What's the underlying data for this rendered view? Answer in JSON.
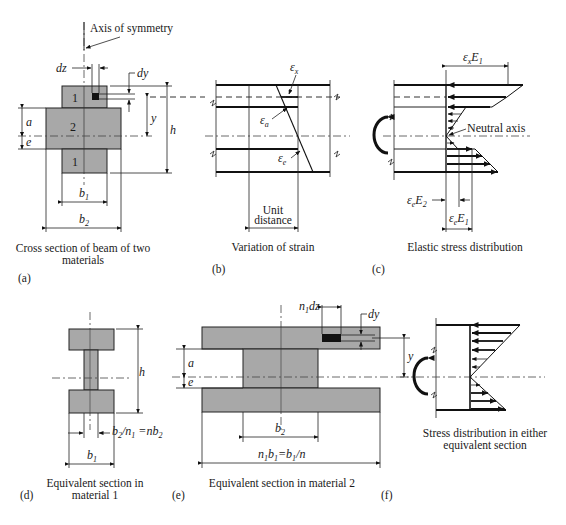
{
  "figure": {
    "panels": [
      {
        "id": "a",
        "tag": "(a)",
        "caption_lines": [
          "Cross section of beam of two",
          "materials"
        ],
        "labels": {
          "axis": "Axis of symmetry",
          "dz": "dz",
          "dy": "dy",
          "region_top": "1",
          "region_mid": "2",
          "region_bot": "1",
          "a": "a",
          "e": "e",
          "y": "y",
          "h": "h",
          "b1": "b",
          "b1_sub": "1",
          "b2": "b",
          "b2_sub": "2"
        }
      },
      {
        "id": "b",
        "tag": "(b)",
        "caption_lines": [
          "Variation of strain"
        ],
        "labels": {
          "ex": "ε",
          "ex_sub": "x",
          "ea": "ε",
          "ea_sub": "a",
          "ee": "ε",
          "ee_sub": "e",
          "unit1": "Unit",
          "unit2": "distance"
        }
      },
      {
        "id": "c",
        "tag": "(c)",
        "caption_lines": [
          "Elastic stress distribution"
        ],
        "labels": {
          "top": "ε",
          "top_sub": "x",
          "top_E": "E",
          "top_E_sub": "1",
          "neutral": "Neutral axis",
          "e2": "ε",
          "e2_sub": "e",
          "e2_E": "E",
          "e2_E_sub": "2",
          "e1": "ε",
          "e1_sub": "e",
          "e1_E": "E",
          "e1_E_sub": "1"
        }
      },
      {
        "id": "d",
        "tag": "(d)",
        "caption_lines": [
          "Equivalent section in",
          "material 1"
        ],
        "labels": {
          "h": "h",
          "web": "b",
          "web_sub": "2",
          "web_mid": "/n",
          "web_mid_sub": "1",
          "web_eq": " =nb",
          "web_eq_sub": "2",
          "b1": "b",
          "b1_sub": "1"
        }
      },
      {
        "id": "e",
        "tag": "(e)",
        "caption_lines": [
          "Equivalent section in material 2"
        ],
        "labels": {
          "n1dz": "n",
          "n1dz_sub": "1",
          "n1dz_rest": "dz",
          "dy": "dy",
          "y": "y",
          "a": "a",
          "e": "e",
          "b2": "b",
          "b2_sub": "2",
          "width": "n",
          "width_sub": "1",
          "width_b": "b",
          "width_b_sub": "1",
          "width_eq": "=b",
          "width_eq_sub": "1",
          "width_tail": "/n"
        }
      },
      {
        "id": "f",
        "tag": "(f)",
        "caption_lines": [
          "Stress distribution in either",
          "equivalent section"
        ],
        "labels": {}
      }
    ]
  }
}
